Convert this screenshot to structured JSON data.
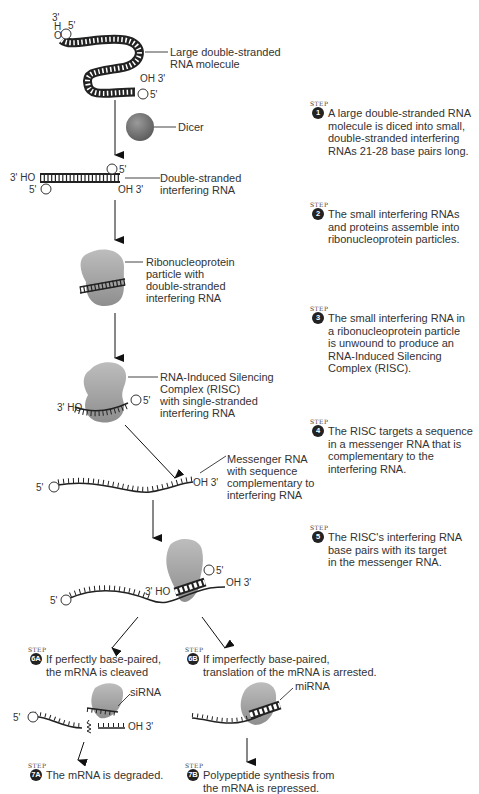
{
  "diagram": {
    "labels": {
      "large_dsrna": "Large double-stranded\nRNA molecule",
      "dicer": "Dicer",
      "dsirna": "Double-stranded\ninterfering RNA",
      "rnp": "Ribonucleoprotein\nparticle with\ndouble-stranded\ninterfering RNA",
      "risc": "RNA-Induced Silencing\nComplex (RISC)\nwith single-stranded\ninterfering RNA",
      "mrna": "Messenger RNA\nwith sequence\ncomplementary to\ninterfering RNA",
      "sirna": "siRNA",
      "mirna": "miRNA"
    },
    "end_labels": {
      "three_prime_h": "3'",
      "h": "H",
      "o": "O",
      "five_prime": "5'",
      "oh3": "OH 3'",
      "ho3": "3' HO",
      "p5_left": "5'",
      "p": "P"
    },
    "step_tag": "STEP",
    "steps": [
      {
        "id": "1",
        "text": "A large double-stranded RNA\nmolecule is diced into small,\ndouble-stranded interfering\nRNAs 21-28 base pairs long."
      },
      {
        "id": "2",
        "text": "The small interfering RNAs\nand proteins assemble into\nribonucleoprotein particles."
      },
      {
        "id": "3",
        "text": "The small interfering RNA in\na ribonucleoprotein particle\nis unwound to produce an\nRNA-Induced Silencing\nComplex (RISC)."
      },
      {
        "id": "4",
        "text": "The RISC targets a sequence\nin a messenger RNA that is\ncomplementary to the\ninterfering RNA."
      },
      {
        "id": "5",
        "text": "The RISC's interfering RNA\nbase pairs with its target\nin the messenger RNA."
      },
      {
        "id": "6A",
        "text": "If perfectly base-paired,\nthe mRNA is cleaved"
      },
      {
        "id": "6B",
        "text": "If imperfectly base-paired,\ntranslation of the mRNA is arrested."
      },
      {
        "id": "7A",
        "text": "The mRNA is degraded."
      },
      {
        "id": "7B",
        "text": "Polypeptide synthesis from\nthe mRNA is repressed."
      }
    ],
    "colors": {
      "protein_gray": "#a8a8a8",
      "dicer_gray": "#7a7a7a",
      "strand": "#222222",
      "badge": "#222222"
    }
  }
}
